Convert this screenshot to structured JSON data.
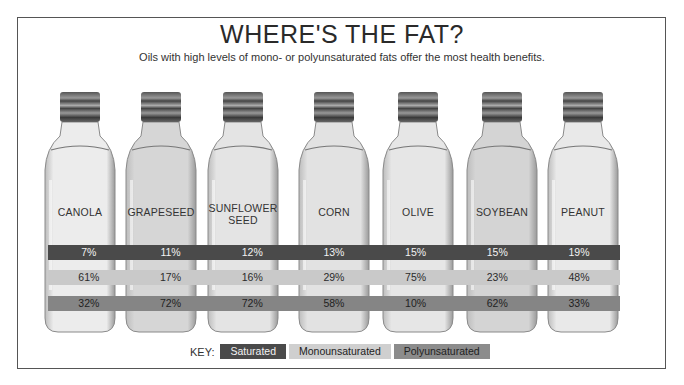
{
  "header": {
    "title": "WHERE'S THE FAT?",
    "subtitle": "Oils with high levels of mono- or polyunsaturated fats offer the most health benefits."
  },
  "key": {
    "label": "KEY:",
    "items": [
      {
        "name": "Saturated",
        "color": "#4a4a4a"
      },
      {
        "name": "Monounsaturated",
        "color": "#c9c9c9"
      },
      {
        "name": "Polyunsaturated",
        "color": "#858585"
      }
    ]
  },
  "oils": [
    {
      "label": "CANOLA",
      "saturated": "7%",
      "mono": "61%",
      "poly": "32%",
      "tint": "#ececec"
    },
    {
      "label": "GRAPESEED",
      "saturated": "11%",
      "mono": "17%",
      "poly": "72%",
      "tint": "#d6d6d6"
    },
    {
      "label": "SUNFLOWER SEED",
      "saturated": "12%",
      "mono": "16%",
      "poly": "72%",
      "tint": "#e4e4e4"
    },
    {
      "label": "CORN",
      "saturated": "13%",
      "mono": "29%",
      "poly": "58%",
      "tint": "#e2e2e2"
    },
    {
      "label": "OLIVE",
      "saturated": "15%",
      "mono": "75%",
      "poly": "10%",
      "tint": "#e6e6e6"
    },
    {
      "label": "SOYBEAN",
      "saturated": "15%",
      "mono": "23%",
      "poly": "62%",
      "tint": "#d4d4d4"
    },
    {
      "label": "PEANUT",
      "saturated": "19%",
      "mono": "48%",
      "poly": "33%",
      "tint": "#e9e9e9"
    }
  ],
  "chart_data": {
    "type": "table",
    "title": "WHERE'S THE FAT?",
    "subtitle": "Oils with high levels of mono- or polyunsaturated fats offer the most health benefits.",
    "categories": [
      "Canola",
      "Grapeseed",
      "Sunflower Seed",
      "Corn",
      "Olive",
      "Soybean",
      "Peanut"
    ],
    "series": [
      {
        "name": "Saturated",
        "values": [
          7,
          11,
          12,
          13,
          15,
          15,
          19
        ]
      },
      {
        "name": "Monounsaturated",
        "values": [
          61,
          17,
          16,
          29,
          75,
          23,
          48
        ]
      },
      {
        "name": "Polyunsaturated",
        "values": [
          32,
          72,
          72,
          58,
          10,
          62,
          33
        ]
      }
    ],
    "unit": "%",
    "legend": {
      "position": "bottom",
      "entries": [
        "Saturated",
        "Monounsaturated",
        "Polyunsaturated"
      ]
    }
  }
}
